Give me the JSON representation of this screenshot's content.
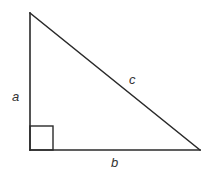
{
  "diagram": {
    "type": "right-triangle",
    "background": "#ffffff",
    "stroke_color": "#2a2a2a",
    "label_color": "#333333",
    "vertices": {
      "top": {
        "x": 30,
        "y": 13
      },
      "right_angle": {
        "x": 30,
        "y": 150
      },
      "right": {
        "x": 200,
        "y": 150
      }
    },
    "right_angle_marker": {
      "x": 30,
      "y": 126,
      "size": 24
    },
    "labels": {
      "a": "a",
      "b": "b",
      "c": "c"
    },
    "label_positions": {
      "a": {
        "x": 12,
        "y": 101
      },
      "b": {
        "x": 111,
        "y": 167
      },
      "c": {
        "x": 129,
        "y": 84
      }
    },
    "sides": [
      {
        "name": "a",
        "description": "vertical leg"
      },
      {
        "name": "b",
        "description": "horizontal leg"
      },
      {
        "name": "c",
        "description": "hypotenuse"
      }
    ]
  }
}
